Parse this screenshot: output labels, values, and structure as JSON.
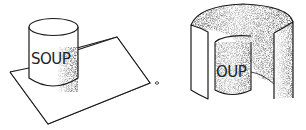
{
  "figures": [
    {
      "id": "flat-sheet",
      "description": "Soup can standing on a flat sheet of paper",
      "can_label": "SOUP"
    },
    {
      "id": "curled-sheet",
      "description": "Sheet of paper curled into a cylinder around the soup can",
      "can_label": "OUP"
    }
  ],
  "colors": {
    "ink": "#1a1a1a",
    "paper": "#ffffff",
    "shade": "#9a9a9a"
  }
}
